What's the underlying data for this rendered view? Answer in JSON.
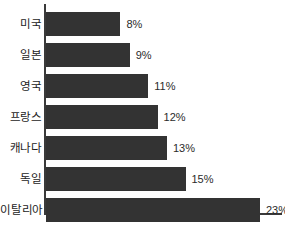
{
  "chart_data": {
    "type": "bar",
    "orientation": "horizontal",
    "title": "",
    "subtitle": "",
    "xlabel": "",
    "ylabel": "",
    "grid": false,
    "legend": "none",
    "xlim": [
      0,
      25
    ],
    "value_suffix": "%",
    "categories": [
      "미국",
      "일본",
      "영국",
      "프랑스",
      "캐나다",
      "독일",
      "이탈리아"
    ],
    "values": [
      8,
      9,
      11,
      12,
      13,
      15,
      23
    ],
    "value_labels": [
      "8%",
      "9%",
      "11%",
      "12%",
      "13%",
      "15%",
      "23%"
    ],
    "bars": [
      {
        "category": "미국",
        "value": 8,
        "label": "8%"
      },
      {
        "category": "일본",
        "value": 9,
        "label": "9%"
      },
      {
        "category": "영국",
        "value": 11,
        "label": "11%"
      },
      {
        "category": "프랑스",
        "value": 12,
        "label": "12%"
      },
      {
        "category": "캐나다",
        "value": 13,
        "label": "13%"
      },
      {
        "category": "독일",
        "value": 15,
        "label": "15%"
      },
      {
        "category": "이탈리아",
        "value": 23,
        "label": "23%"
      }
    ],
    "colors": {
      "bar_fill": "#333333",
      "axis": "#3a3a3a",
      "background": "#ffffff",
      "category_text": "#1c1c1c",
      "value_text": "#2b2b2b"
    },
    "px_per_unit": 9.3
  }
}
